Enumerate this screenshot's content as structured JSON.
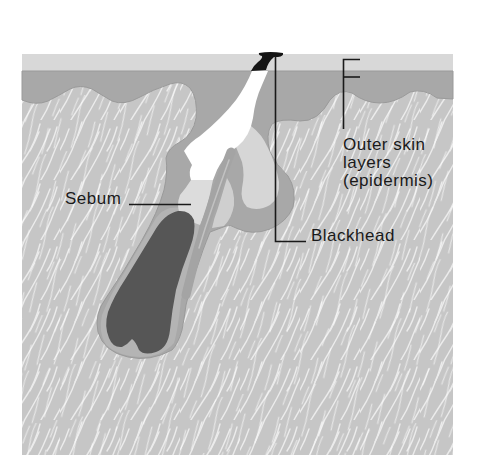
{
  "labels": {
    "epidermis_lines": [
      "Outer skin",
      "layers",
      "(epidermis)"
    ],
    "sebum": "Sebum",
    "blackhead": "Blackhead"
  },
  "colors": {
    "background": "#ffffff",
    "surface_strip": "#d8d8d8",
    "epidermis": "#a8a8a8",
    "dermis": "#c6c6c6",
    "dermis_fibers": "#f2f2f2",
    "pore_opening": "#ffffff",
    "sebum_region": "#dcdcdc",
    "gland_interior": "#d6d6d6",
    "inner_sheath": "#b4b4b4",
    "hair_bulb": "#565656",
    "blackhead_plug": "#141414",
    "leader_lines": "#1a1a1a"
  }
}
